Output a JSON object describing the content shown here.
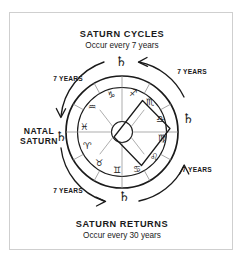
{
  "diagram": {
    "title_top": "SATURN CYCLES",
    "subtitle_top": "Occur every 7 years",
    "title_bottom": "SATURN  RETURNS",
    "subtitle_bottom": "Occur every 30 years",
    "natal_label_line1": "NATAL",
    "natal_label_line2": "SATURN",
    "saturn_glyph": "♄",
    "interval_labels": [
      {
        "id": "top-left",
        "text": "7 YEARS"
      },
      {
        "id": "top-right",
        "text": "7 YEARS"
      },
      {
        "id": "bottom-left",
        "text": "7 YEARS"
      },
      {
        "id": "bottom-right",
        "text": "7 YEARS"
      }
    ],
    "saturn_markers": [
      {
        "id": "natal-saturn-left",
        "glyph": "♄",
        "position": "left"
      },
      {
        "id": "saturn-top",
        "glyph": "♄",
        "position": "top"
      },
      {
        "id": "saturn-right",
        "glyph": "♄",
        "position": "right"
      },
      {
        "id": "saturn-bottom",
        "glyph": "♄",
        "position": "bottom"
      }
    ],
    "zodiac_signs": [
      {
        "name": "Capricorn",
        "glyph": "♑"
      },
      {
        "name": "Aquarius",
        "glyph": "♒"
      },
      {
        "name": "Pisces",
        "glyph": "♓"
      },
      {
        "name": "Aries",
        "glyph": "♈"
      },
      {
        "name": "Taurus",
        "glyph": "♉"
      },
      {
        "name": "Gemini",
        "glyph": "♊"
      },
      {
        "name": "Cancer",
        "glyph": "♋"
      },
      {
        "name": "Leo",
        "glyph": "♌"
      },
      {
        "name": "Virgo",
        "glyph": "♍"
      },
      {
        "name": "Libra",
        "glyph": "♎"
      },
      {
        "name": "Scorpio",
        "glyph": "♏"
      },
      {
        "name": "Sagittarius",
        "glyph": "♐"
      }
    ],
    "colors": {
      "ink": "#1a1a1a",
      "frame": "#cfcfcf",
      "spoke": "#8a8a8a",
      "background": "#ffffff"
    }
  }
}
